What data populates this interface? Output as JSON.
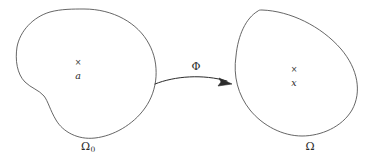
{
  "figure": {
    "type": "deformation-map-diagram",
    "background_color": "#ffffff",
    "stroke_color": "#555555",
    "text_color": "#2b2b2b"
  },
  "reference_domain": {
    "label": "Ω",
    "subscript": "0",
    "label_full": "Ω₀",
    "label_x": 88,
    "label_y": 146,
    "shape": "kidney-blob",
    "marker_glyph": "×",
    "marker_x": 78,
    "marker_y": 63,
    "point_label": "a",
    "point_label_x": 78,
    "point_label_y": 76
  },
  "current_domain": {
    "label": "Ω",
    "label_x": 310,
    "label_y": 146,
    "shape": "tilted-oval",
    "marker_glyph": "×",
    "marker_x": 294,
    "marker_y": 70,
    "point_label": "x",
    "point_label_x": 294,
    "point_label_y": 83
  },
  "mapping": {
    "label": "Φ",
    "label_x": 196,
    "label_y": 66,
    "arrow_from_x": 155,
    "arrow_from_y": 84,
    "arrow_to_x": 231,
    "arrow_to_y": 84
  }
}
